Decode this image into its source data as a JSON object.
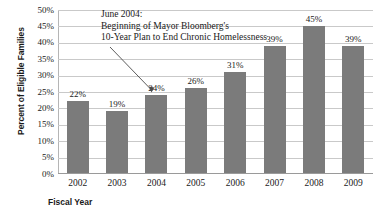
{
  "chart_data": {
    "type": "bar",
    "title": "",
    "xlabel": "Fiscal Year",
    "ylabel": "Percent of Eligible Families",
    "categories": [
      "2002",
      "2003",
      "2004",
      "2005",
      "2006",
      "2007",
      "2008",
      "2009"
    ],
    "values": [
      22,
      19,
      24,
      26,
      31,
      39,
      45,
      39
    ],
    "value_labels": [
      "22%",
      "19%",
      "24%",
      "26%",
      "31%",
      "39%",
      "45%",
      "39%"
    ],
    "ylim": [
      0,
      50
    ],
    "ytick_values": [
      50,
      45,
      40,
      35,
      30,
      25,
      20,
      15,
      10,
      5,
      0
    ],
    "ytick_labels": [
      "50%",
      "45%",
      "40%",
      "35%",
      "30%",
      "25%",
      "20%",
      "15%",
      "10%",
      "5%",
      "0%"
    ],
    "grid": true,
    "legend": false,
    "bar_color": "#7b7b7b",
    "gridline_color": "#c9c9c9",
    "annotations": [
      {
        "name": "june-2004-annotation",
        "lines": [
          "June 2004:",
          "Beginning of Mayor Bloomberg's",
          "10-Year Plan to End Chronic Homelessness"
        ],
        "points_to_category": "2004"
      }
    ]
  }
}
